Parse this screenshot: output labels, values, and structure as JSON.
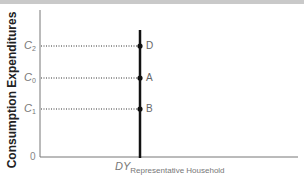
{
  "diagram": {
    "y_axis_label": "Consumption Expenditures",
    "x_axis_label": {
      "main": "DY",
      "subscript": "Representative Household"
    },
    "origin_label": "0",
    "y_ticks": [
      {
        "name": "C",
        "sub": "2",
        "point": "D"
      },
      {
        "name": "C",
        "sub": "0",
        "point": "A"
      },
      {
        "name": "C",
        "sub": "1",
        "point": "B"
      }
    ],
    "colors": {
      "axis": "#777777",
      "vertical_line": "#111111",
      "dotted": "#333333",
      "label_text": "#777777",
      "top_band": "#c9c9c9"
    }
  }
}
